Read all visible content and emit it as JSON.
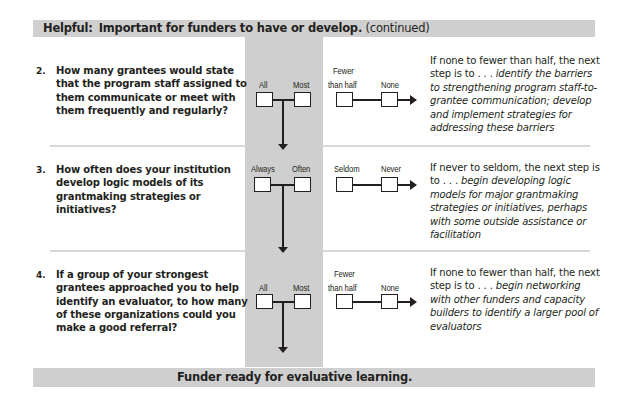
{
  "header": {
    "prefix": "Helpful:",
    "title": "Important for funders to have or develop.",
    "suffix": "(continued)"
  },
  "footer": {
    "text": "Funder ready for evaluative learning."
  },
  "colors": {
    "band_gray": "#cfcfcf",
    "text": "#231f20",
    "divider": "#d8d8d8"
  },
  "questions": [
    {
      "number": "2.",
      "text": "How many grantees would state that the program staff assigned to them communicate or meet with them frequently and regularly?",
      "positive_options": [
        "All",
        "Most"
      ],
      "negative_options": [
        "Fewer than half",
        "None"
      ],
      "negative_line1": "Fewer",
      "negative_line2": "than half",
      "answer_lead": "If none to fewer than half, the next step is to . . .",
      "answer_action": "identify the barriers to strengthening program staff-to-grantee communication; develop and implement strategies for addressing these barriers"
    },
    {
      "number": "3.",
      "text": "How often does your institution develop logic models of its grantmaking strategies or initiatives?",
      "positive_options": [
        "Always",
        "Often"
      ],
      "negative_options": [
        "Seldom",
        "Never"
      ],
      "answer_lead": "If never to seldom, the next step is to . . .",
      "answer_action": "begin developing logic models for major grantmaking strategies or initiatives, perhaps with some outside assistance or facilitation"
    },
    {
      "number": "4.",
      "text": "If a group of your strongest grantees approached you to help identify an evaluator, to how many of these organizations could you make a good referral?",
      "positive_options": [
        "All",
        "Most"
      ],
      "negative_options": [
        "Fewer than half",
        "None"
      ],
      "negative_line1": "Fewer",
      "negative_line2": "than half",
      "answer_lead": "If none to fewer than half, the next step is to . . .",
      "answer_action": "begin networking with other funders and capacity builders to identify a larger pool of evaluators"
    }
  ]
}
